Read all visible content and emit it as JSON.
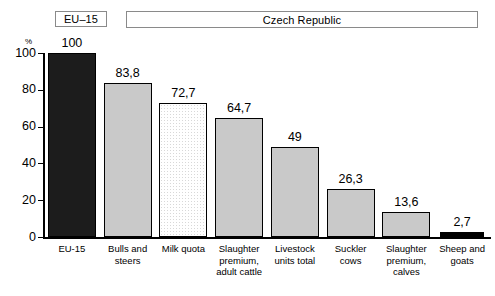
{
  "header": {
    "eu_box_label": "EU–15",
    "country_box_label": "Czech Republic"
  },
  "axis": {
    "unit_label": "%",
    "y_ticks": [
      "100",
      "80",
      "60",
      "40",
      "20",
      "0"
    ]
  },
  "chart_data": {
    "type": "bar",
    "title": "",
    "subtitle": "",
    "xlabel": "",
    "ylabel": "%",
    "ylim": [
      0,
      100
    ],
    "yticks": [
      0,
      20,
      40,
      60,
      80,
      100
    ],
    "grid": false,
    "legend": "none",
    "categories": [
      "EU-15",
      "Bulls and steers",
      "Milk quota",
      "Slaughter premium, adult cattle",
      "Livestock units total",
      "Suckler cows",
      "Slaughter premium, calves",
      "Sheep and goats"
    ],
    "category_lines": [
      [
        "EU-15"
      ],
      [
        "Bulls and",
        "steers"
      ],
      [
        "Milk quota"
      ],
      [
        "Slaughter",
        "premium,",
        "adult cattle"
      ],
      [
        "Livestock",
        "units total"
      ],
      [
        "Suckler",
        "cows"
      ],
      [
        "Slaughter",
        "premium,",
        "calves"
      ],
      [
        "Sheep and",
        "goats"
      ]
    ],
    "values": [
      100,
      83.8,
      72.7,
      64.7,
      49,
      26.3,
      13.6,
      2.7
    ],
    "value_labels": [
      "100",
      "83,8",
      "72,7",
      "64,7",
      "49",
      "26,3",
      "13,6",
      "2,7"
    ],
    "bar_styles": [
      "dark",
      "gray",
      "dots",
      "gray",
      "gray",
      "gray",
      "gray",
      "black"
    ]
  },
  "colors": {
    "bar_dark": "#1c1c1c",
    "bar_gray": "#c9c9c9",
    "bar_dots_bg": "#ffffff",
    "bar_black": "#000000",
    "axis": "#000000",
    "box_border": "#8a8a8a"
  }
}
